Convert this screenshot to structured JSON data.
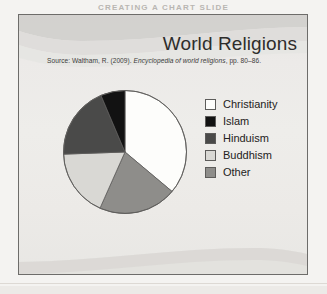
{
  "page": {
    "running_head": "CREATING A CHART SLIDE"
  },
  "slide": {
    "title": "World Religions",
    "source_prefix": "Source: Waltham, R. (2009). ",
    "source_italic": "Encyclopedia of world religions",
    "source_suffix": ", pp. 80–86."
  },
  "colors": {
    "christianity": "#fdfdfb",
    "islam": "#121212",
    "hinduism": "#4a4a49",
    "buddhism": "#d9d8d4",
    "other": "#8e8d8a",
    "slice_outline": "#5d5c5a",
    "frame_border": "#6d6c6a",
    "slide_background": "#ebeae7",
    "title_text": "#2e2d2c"
  },
  "legend": {
    "items": [
      {
        "label": "Christianity",
        "color": "#fdfdfb"
      },
      {
        "label": "Islam",
        "color": "#121212"
      },
      {
        "label": "Hinduism",
        "color": "#4a4a49"
      },
      {
        "label": "Buddhism",
        "color": "#d9d8d4"
      },
      {
        "label": "Other",
        "color": "#8e8d8a"
      }
    ]
  },
  "chart_data": {
    "type": "pie",
    "title": "World Religions",
    "subtitle": "Source: Waltham, R. (2009). Encyclopedia of world religions, pp. 80–86.",
    "xlabel": "",
    "ylabel": "",
    "legend_position": "right",
    "grid": false,
    "start_angle_deg": 0,
    "direction": "counter-clockwise",
    "categories": [
      "Christianity",
      "Islam",
      "Hinduism",
      "Buddhism",
      "Other"
    ],
    "values": [
      36,
      6,
      19,
      18,
      21
    ],
    "unit": "percent",
    "colors": [
      "#fdfdfb",
      "#121212",
      "#4a4a49",
      "#d9d8d4",
      "#8e8d8a"
    ],
    "slices": [
      {
        "label": "Christianity",
        "value": 36,
        "color": "#fdfdfb",
        "start_deg": 0,
        "end_deg": 130
      },
      {
        "label": "Other",
        "value": 21,
        "color": "#8e8d8a",
        "start_deg": 130,
        "end_deg": 204
      },
      {
        "label": "Buddhism",
        "value": 18,
        "color": "#d9d8d4",
        "start_deg": 204,
        "end_deg": 268
      },
      {
        "label": "Hinduism",
        "value": 19,
        "color": "#4a4a49",
        "start_deg": 268,
        "end_deg": 337
      },
      {
        "label": "Islam",
        "value": 6,
        "color": "#121212",
        "start_deg": 337,
        "end_deg": 360
      }
    ]
  }
}
